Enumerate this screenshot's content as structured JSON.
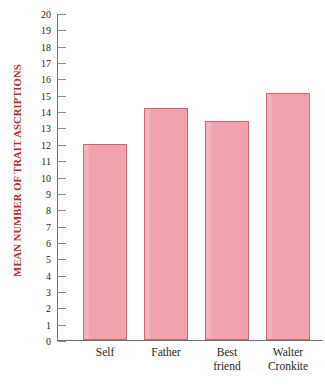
{
  "chart_data": {
    "type": "bar",
    "title": "",
    "xlabel": "",
    "ylabel": "MEAN NUMBER OF TRAIT ASCRIPTIONS",
    "categories": [
      "Self",
      "Father",
      "Best friend",
      "Walter Cronkite"
    ],
    "category_lines": [
      [
        "Self"
      ],
      [
        "Father"
      ],
      [
        "Best",
        "friend"
      ],
      [
        "Walter",
        "Cronkite"
      ]
    ],
    "values": [
      12.0,
      14.2,
      13.4,
      15.1
    ],
    "ylim": [
      0,
      20
    ],
    "ytick_step": 1,
    "yticks": [
      20,
      19,
      18,
      17,
      16,
      15,
      14,
      13,
      12,
      11,
      10,
      9,
      8,
      7,
      6,
      5,
      4,
      3,
      2,
      1,
      0
    ],
    "grid": false,
    "legend": null,
    "bar_fill_color": "#f0a3ad",
    "bar_border_color": "#d4636f",
    "axis_color": "#6d6d6d",
    "tick_color": "#8a8a8a",
    "ylabel_color": "#c0272d",
    "ticklabel_color": "#231f20"
  },
  "caption": {
    "text": ""
  }
}
